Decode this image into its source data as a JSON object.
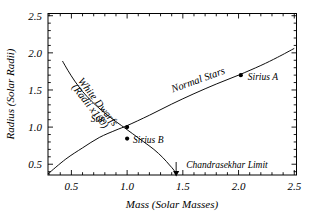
{
  "chart_data": {
    "type": "line",
    "title": "",
    "xlabel": "Mass (Solar Masses)",
    "ylabel": "Radius (Solar Radii)",
    "xlim": [
      0.29,
      2.52
    ],
    "ylim": [
      0.355,
      2.53
    ],
    "xticks": [
      "0.5",
      "1.0",
      "1.5",
      "2.0",
      "2.5"
    ],
    "xtick_values": [
      0.5,
      1.0,
      1.5,
      2.0,
      2.5
    ],
    "yticks": [
      "0.5",
      "1.0",
      "1.5",
      "2.0",
      "2.5"
    ],
    "ytick_values": [
      0.5,
      1.0,
      1.5,
      2.0,
      2.5
    ],
    "grid": false,
    "legend": "none",
    "minor_ticks_per_major": 5,
    "series": [
      {
        "name": "White Dwarfs (Radii x100)",
        "label": "White Dwarfs",
        "label_line2": "(Radii x100)",
        "label_rotation": 52,
        "points": [
          [
            0.42,
            1.89
          ],
          [
            0.47,
            1.76
          ],
          [
            0.53,
            1.62
          ],
          [
            0.6,
            1.48
          ],
          [
            0.68,
            1.35
          ],
          [
            0.76,
            1.24
          ],
          [
            0.85,
            1.13
          ],
          [
            0.95,
            1.02
          ],
          [
            1.05,
            0.91
          ],
          [
            1.15,
            0.8
          ],
          [
            1.24,
            0.7
          ],
          [
            1.32,
            0.59
          ],
          [
            1.38,
            0.49
          ],
          [
            1.42,
            0.42
          ],
          [
            1.44,
            0.36
          ]
        ]
      },
      {
        "name": "Normal Stars",
        "label": "Normal Stars",
        "label_rotation": -20,
        "points": [
          [
            0.29,
            0.37
          ],
          [
            0.45,
            0.57
          ],
          [
            0.6,
            0.72
          ],
          [
            0.75,
            0.86
          ],
          [
            0.9,
            0.96
          ],
          [
            1.0,
            1.02
          ],
          [
            1.2,
            1.16
          ],
          [
            1.4,
            1.31
          ],
          [
            1.6,
            1.45
          ],
          [
            1.8,
            1.58
          ],
          [
            2.0,
            1.7
          ],
          [
            2.2,
            1.83
          ],
          [
            2.35,
            1.94
          ],
          [
            2.5,
            2.06
          ]
        ]
      }
    ],
    "data_points": [
      {
        "name": "Sun",
        "label": "Sun",
        "x": 1.0,
        "y": 1.0,
        "label_dx": -22,
        "label_dy": -5
      },
      {
        "name": "Sirius B",
        "label": "Sirius B",
        "x": 1.0,
        "y": 0.845,
        "label_dx": 6,
        "label_dy": 4
      },
      {
        "name": "Sirius A",
        "label": "Sirius A",
        "x": 2.02,
        "y": 1.7,
        "label_dx": 7,
        "label_dy": 5
      }
    ],
    "annotations": [
      {
        "name": "Chandrasekhar Limit",
        "label": "Chandrasekhar Limit",
        "x": 1.44,
        "y": 0.355,
        "arrow": "down-arrow",
        "arrow_from_y": 0.53,
        "arrow_to_y": 0.39,
        "label_x": 1.53,
        "label_y": 0.495
      }
    ],
    "colors": {
      "axis": "#000000",
      "curve": "#000000",
      "marker": "#000000",
      "text": "#000000",
      "background": "#ffffff"
    }
  }
}
